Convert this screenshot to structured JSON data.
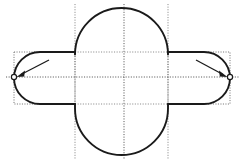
{
  "figure": {
    "background_color": "#ffffff",
    "outline_color": "#1a1a1a",
    "construction_color": "#8c8c8c",
    "width": 246,
    "height": 163
  },
  "geometry": {
    "center": {
      "x": 124,
      "y": 77
    },
    "vertical_stadium": {
      "name": "vertical-oval",
      "left_x": 75,
      "right_x": 168,
      "top_y": 8,
      "bottom_y": 155,
      "radius": 46.5
    },
    "horizontal_stadium": {
      "name": "horizontal-capsule",
      "left_x": 14,
      "right_x": 230,
      "top_y": 52,
      "bottom_y": 104,
      "radius": 26
    }
  },
  "construction": {
    "vertical_lines_x": [
      75,
      124,
      168
    ],
    "horizontal_lines_y": [
      52,
      77,
      104
    ],
    "vertical_line_top_y": 4,
    "vertical_line_bottom_y": 159,
    "horizontal_line_left_x": 6,
    "horizontal_line_right_x": 240,
    "bounding_box_left": {
      "x": 14,
      "y": 52,
      "width": 61,
      "height": 52
    },
    "bounding_box_right": {
      "x": 168,
      "y": 52,
      "width": 62,
      "height": 52
    }
  },
  "annotations": [
    {
      "name": "left-vertex-callout",
      "label": "",
      "arrow_from": {
        "x": 49,
        "y": 60
      },
      "arrow_to": {
        "x": 17,
        "y": 76
      },
      "marker": {
        "x": 14,
        "y": 77,
        "r": 2.6
      }
    },
    {
      "name": "right-vertex-callout",
      "label": "",
      "arrow_from": {
        "x": 196,
        "y": 60
      },
      "arrow_to": {
        "x": 227,
        "y": 76
      },
      "marker": {
        "x": 230,
        "y": 77,
        "r": 2.6
      }
    }
  ]
}
